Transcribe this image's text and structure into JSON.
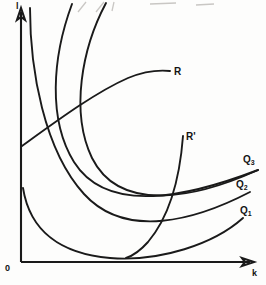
{
  "figure": {
    "kind": "isoquant-map-with-expansion-paths",
    "background_color": "#fdfdfc",
    "ink_color": "#1a1a1a"
  },
  "axes": {
    "y_label": "l",
    "x_label": "k",
    "origin_label": "0"
  },
  "labels": {
    "expansion_path_upper": "R",
    "expansion_path_lower": "R'",
    "isoquant_high": "Q",
    "isoquant_high_sub": "3",
    "isoquant_mid": "Q",
    "isoquant_mid_sub": "2",
    "isoquant_low": "Q",
    "isoquant_low_sub": "1"
  },
  "chart_data": {
    "type": "line",
    "title": "",
    "xlabel": "k",
    "ylabel": "l",
    "grid": false,
    "legend_position": "curve-end-labels",
    "xlim": [
      0,
      266
    ],
    "ylim": [
      0,
      285
    ],
    "note": "Three convex isoquants that bend back upward toward the vertical axis, crossed by two expansion-path curves R and R'.",
    "series": [
      {
        "name": "Q1",
        "label": "Q1",
        "kind": "isoquant",
        "level": 1,
        "label_point": [
          240,
          206
        ],
        "path": "M 23 188 C 30 232, 62 254, 110 258 C 160 262, 214 244, 243 218"
      },
      {
        "name": "Q2",
        "label": "Q2",
        "kind": "isoquant",
        "level": 2,
        "label_point": [
          236,
          180
        ],
        "path": "M 30 8 C 30 70, 44 150, 84 194 C 126 240, 196 220, 250 192"
      },
      {
        "name": "Q3",
        "label": "Q3",
        "kind": "isoquant",
        "level": 3,
        "label_point": [
          243,
          155
        ],
        "path": "M 72 4 C 52 58, 48 120, 74 162 C 108 216, 190 196, 258 170"
      },
      {
        "name": "Q3-outer",
        "label": "",
        "kind": "isoquant",
        "level": 3,
        "label_point": [
          0,
          0
        ],
        "path": "M 106 3 C 82 48, 70 112, 92 158 C 120 214, 196 198, 258 170"
      },
      {
        "name": "R",
        "label": "R",
        "kind": "expansion-path",
        "label_point": [
          174,
          67
        ],
        "path": "M 22 146 C 58 120, 96 92, 128 78 C 145 71, 160 70, 170 71"
      },
      {
        "name": "R'",
        "label": "R'",
        "kind": "expansion-path",
        "label_point": [
          186,
          132
        ],
        "path": "M 183 136 C 180 176, 170 216, 148 242 C 140 251, 132 256, 126 258"
      }
    ]
  },
  "top_bleed": {
    "description": "faint show-through marks cropped at the top edge of the page scan"
  }
}
